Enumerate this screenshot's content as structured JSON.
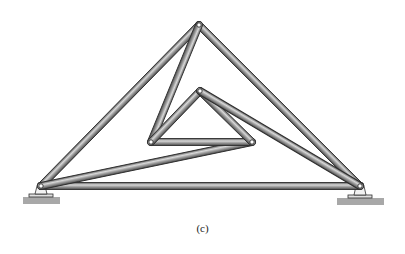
{
  "figure": {
    "caption": "(c)"
  },
  "colors": {
    "member_light": "#d8d8d8",
    "member_mid": "#9a9a9a",
    "member_dark": "#4a4a4a",
    "outline": "#2e2e2e",
    "pin": "#ffffff",
    "ground": "#a8a8a8"
  },
  "joints": [
    {
      "id": "A",
      "label": "left-support",
      "x": 41,
      "y": 186
    },
    {
      "id": "B",
      "label": "top-apex",
      "x": 199,
      "y": 25
    },
    {
      "id": "C",
      "label": "right-support",
      "x": 360,
      "y": 186
    },
    {
      "id": "D",
      "label": "inner-left",
      "x": 151,
      "y": 142
    },
    {
      "id": "E",
      "label": "inner-apex",
      "x": 200,
      "y": 91
    },
    {
      "id": "F",
      "label": "inner-right",
      "x": 252,
      "y": 142
    }
  ],
  "members": [
    {
      "from": "A",
      "to": "B"
    },
    {
      "from": "B",
      "to": "C"
    },
    {
      "from": "A",
      "to": "C"
    },
    {
      "from": "B",
      "to": "D"
    },
    {
      "from": "A",
      "to": "F"
    },
    {
      "from": "D",
      "to": "F"
    },
    {
      "from": "D",
      "to": "E"
    },
    {
      "from": "E",
      "to": "F"
    },
    {
      "from": "E",
      "to": "C"
    }
  ],
  "supports": [
    {
      "joint": "A",
      "type": "pin",
      "ground_x": 23,
      "ground_y": 197,
      "ground_w": 37
    },
    {
      "joint": "C",
      "type": "pin",
      "ground_x": 337,
      "ground_y": 198,
      "ground_w": 47
    }
  ]
}
